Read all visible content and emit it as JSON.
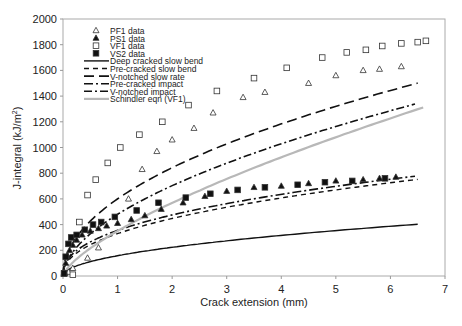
{
  "chart_data": {
    "type": "scatter",
    "title": "",
    "xlabel": "Crack extension (mm)",
    "ylabel": "J-integral (kJ/m²)",
    "xlim": [
      0,
      7
    ],
    "ylim": [
      0,
      2000
    ],
    "xticks": [
      0,
      1,
      2,
      3,
      4,
      5,
      6,
      7
    ],
    "yticks": [
      0,
      200,
      400,
      600,
      800,
      1000,
      1200,
      1400,
      1600,
      1800,
      2000
    ],
    "grid": false,
    "legend_position": "upper left",
    "series": [
      {
        "name": "PF1 data",
        "kind": "markers",
        "marker": "triangle-open",
        "x": [
          0.03,
          0.1,
          0.18,
          0.45,
          0.65,
          1.2,
          1.45,
          1.72,
          2.0,
          2.4,
          2.75,
          3.3,
          3.7,
          4.5,
          5.0,
          5.5,
          5.8,
          6.2
        ],
        "y": [
          20,
          30,
          60,
          140,
          220,
          600,
          830,
          970,
          1060,
          1150,
          1270,
          1390,
          1430,
          1500,
          1560,
          1600,
          1610,
          1630
        ]
      },
      {
        "name": "PS1 data",
        "kind": "markers",
        "marker": "triangle-filled",
        "x": [
          0.02,
          0.05,
          0.08,
          0.12,
          0.18,
          0.25,
          0.35,
          0.5,
          0.65,
          0.8,
          1.0,
          1.25,
          1.5,
          1.8,
          2.2,
          2.6,
          3.0,
          3.5,
          4.0,
          4.5,
          5.0,
          5.5,
          5.8,
          6.1
        ],
        "y": [
          30,
          100,
          160,
          200,
          240,
          280,
          320,
          350,
          370,
          390,
          410,
          440,
          470,
          520,
          570,
          620,
          660,
          690,
          700,
          720,
          740,
          750,
          760,
          770
        ]
      },
      {
        "name": "VF1 data",
        "kind": "markers",
        "marker": "square-open",
        "x": [
          0.02,
          0.18,
          0.3,
          0.45,
          0.6,
          0.82,
          1.05,
          1.4,
          1.82,
          2.3,
          2.82,
          3.5,
          4.1,
          4.75,
          5.2,
          5.55,
          5.85,
          6.2,
          6.5,
          6.65
        ],
        "y": [
          20,
          10,
          420,
          630,
          750,
          880,
          1000,
          1100,
          1200,
          1330,
          1440,
          1540,
          1620,
          1700,
          1740,
          1760,
          1790,
          1810,
          1820,
          1830
        ]
      },
      {
        "name": "VS2 data",
        "kind": "markers",
        "marker": "square-filled",
        "x": [
          0.02,
          0.05,
          0.1,
          0.15,
          0.25,
          0.4,
          0.55,
          0.7,
          0.95,
          1.35,
          1.75,
          2.25,
          2.7,
          3.2,
          3.7,
          4.3,
          4.8,
          5.3,
          5.9
        ],
        "y": [
          20,
          150,
          250,
          300,
          320,
          360,
          400,
          420,
          460,
          510,
          570,
          610,
          640,
          670,
          690,
          710,
          730,
          740,
          760
        ]
      },
      {
        "name": "Deep cracked slow bend",
        "kind": "line",
        "dash": "solid",
        "coef": 158,
        "exp": 0.5,
        "x_end": 6.5
      },
      {
        "name": "Pre-cracked slow bend",
        "kind": "line",
        "dash": "short-dash",
        "coef": 330,
        "exp": 0.44,
        "x_end": 6.5
      },
      {
        "name": "V-notched slow rate",
        "kind": "line",
        "dash": "long-dash",
        "coef": 600,
        "exp": 0.49,
        "x_end": 6.5
      },
      {
        "name": "Pre-cracked impact",
        "kind": "line",
        "dash": "dash-dot-long",
        "coef": 355,
        "exp": 0.42,
        "x_end": 6.45
      },
      {
        "name": "V-notched impact",
        "kind": "line",
        "dash": "dash-dot",
        "coef": 480,
        "exp": 0.55,
        "x_end": 6.45
      },
      {
        "name": "Schindler eqn (VF1)",
        "kind": "line",
        "dash": "solid-grey",
        "coef": 350,
        "exp": 0.7,
        "x_end": 6.6
      }
    ]
  },
  "legend": {
    "items": [
      {
        "label": "PF1 data"
      },
      {
        "label": "PS1 data"
      },
      {
        "label": "VF1 data"
      },
      {
        "label": "VS2 data"
      },
      {
        "label": "Deep cracked slow bend"
      },
      {
        "label": "Pre-cracked slow bend"
      },
      {
        "label": "V-notched slow rate"
      },
      {
        "label": "Pre-cracked impact"
      },
      {
        "label": "V-notched impact"
      },
      {
        "label": "Schindler eqn (VF1)"
      }
    ]
  },
  "axes": {
    "xlabel": "Crack extension (mm)",
    "ylabel_main": "J-integral (kJ/m",
    "ylabel_sup": "2",
    "ylabel_end": ")"
  }
}
